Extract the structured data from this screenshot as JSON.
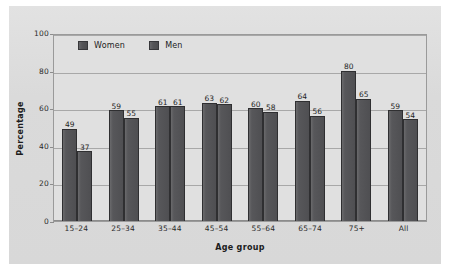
{
  "chart_data": {
    "type": "bar",
    "title": "",
    "xlabel": "Age group",
    "ylabel": "Percentage",
    "categories": [
      "15–24",
      "25–34",
      "35–44",
      "45–54",
      "55–64",
      "65–74",
      "75+",
      "All"
    ],
    "series": [
      {
        "name": "Women",
        "values": [
          49,
          59,
          61,
          63,
          60,
          64,
          80,
          59
        ],
        "color": "#58585a"
      },
      {
        "name": "Men",
        "values": [
          37,
          55,
          61,
          62,
          58,
          56,
          65,
          54
        ],
        "color": "#58585a"
      }
    ],
    "ylim": [
      0,
      100
    ],
    "yticks": [
      0,
      20,
      40,
      60,
      80,
      100
    ],
    "ytick_labels": [
      "0",
      "20",
      "40",
      "60",
      "80",
      "100"
    ],
    "grid": true,
    "grid_axis": "y",
    "legend_position": "top-left-inside",
    "data_labels": true,
    "background_color": "#dcdcdc",
    "plot_background_color": "#e0e0e0",
    "axis_color": "#9a9a9a",
    "grid_color": "#a8a8a8"
  },
  "legend": {
    "items": [
      {
        "label": "Women"
      },
      {
        "label": "Men"
      }
    ]
  },
  "axes": {
    "y_label": "Percentage",
    "x_label": "Age group",
    "y_ticks": [
      "100",
      "80",
      "60",
      "40",
      "20",
      "0"
    ],
    "x_ticks": [
      "15–24",
      "25–34",
      "35–44",
      "45–54",
      "55–64",
      "65–74",
      "75+",
      "All"
    ]
  }
}
